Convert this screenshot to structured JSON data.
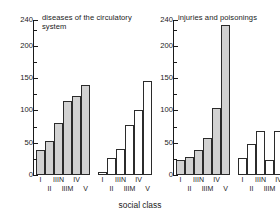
{
  "chart_data": [
    {
      "type": "bar",
      "title": "diseases of the circulatory system",
      "xlabel": "social class",
      "ylabel": "",
      "ylim": [
        0,
        240
      ],
      "yticks": [
        0,
        25,
        50,
        75,
        100,
        125,
        150,
        175,
        200,
        225
      ],
      "ytick_labels": [
        "0",
        "50",
        "100",
        "150",
        "200",
        "240"
      ],
      "ytick_label_values": [
        0,
        50,
        100,
        150,
        200,
        240
      ],
      "grid": false,
      "legend": "none",
      "categories": [
        "I",
        "II",
        "IIIN",
        "IIIM",
        "IV",
        "V"
      ],
      "series": [
        {
          "name": "filled",
          "fill": "#d2d2d2",
          "values": [
            38,
            52,
            80,
            114,
            122,
            140
          ]
        },
        {
          "name": "open",
          "fill": "#ffffff",
          "values": [
            4,
            26,
            41,
            77,
            101,
            146
          ]
        }
      ]
    },
    {
      "type": "bar",
      "title": "injuries and poisonings",
      "xlabel": "social class",
      "ylabel": "",
      "ylim": [
        0,
        240
      ],
      "yticks": [
        0,
        25,
        50,
        75,
        100,
        125,
        150,
        175,
        200,
        225
      ],
      "ytick_labels": [
        "0",
        "50",
        "100",
        "150",
        "200",
        "240"
      ],
      "ytick_label_values": [
        0,
        50,
        100,
        150,
        200,
        240
      ],
      "grid": false,
      "legend": "none",
      "categories": [
        "I",
        "II",
        "IIIN",
        "IIIM",
        "IV",
        "V"
      ],
      "series": [
        {
          "name": "filled",
          "fill": "#d2d2d2",
          "values": [
            23,
            28,
            39,
            57,
            103,
            232
          ]
        },
        {
          "name": "open",
          "fill": "#ffffff",
          "values": [
            27,
            0,
            48,
            68,
            24,
            68,
            100
          ]
        }
      ]
    }
  ],
  "panels": [
    {
      "title": "diseases of the circulatory system",
      "ytick_labels": [
        "240",
        "200",
        "150",
        "100",
        "50",
        "0"
      ],
      "categories": [
        "I",
        "II",
        "IIIN",
        "IIIM",
        "IV",
        "V"
      ],
      "filled_values": [
        38,
        52,
        80,
        114,
        122,
        140
      ],
      "open_values": [
        4,
        26,
        41,
        77,
        101,
        146
      ]
    },
    {
      "title": "injuries and poisonings",
      "ytick_labels": [
        "240",
        "200",
        "150",
        "100",
        "50",
        "0"
      ],
      "categories": [
        "I",
        "II",
        "IIIN",
        "IIIM",
        "IV",
        "V"
      ],
      "filled_values": [
        23,
        28,
        39,
        57,
        103,
        232
      ],
      "open_values": [
        27,
        48,
        68,
        24,
        68,
        100
      ]
    }
  ],
  "axis": {
    "x_title": "social class",
    "y_max": 240,
    "y_labels": [
      "240",
      "200",
      "150",
      "100",
      "50",
      "0"
    ],
    "y_label_values": [
      240,
      200,
      150,
      100,
      50,
      0
    ],
    "y_minor_ticks": [
      225,
      175,
      125,
      75,
      25
    ]
  },
  "colors": {
    "bar_filled": "#d2d2d2",
    "bar_open": "#ffffff",
    "bar_stroke": "#2b2b2b",
    "axis": "#1a1a1a",
    "text": "#1a1a1a",
    "background": "#ffffff"
  }
}
